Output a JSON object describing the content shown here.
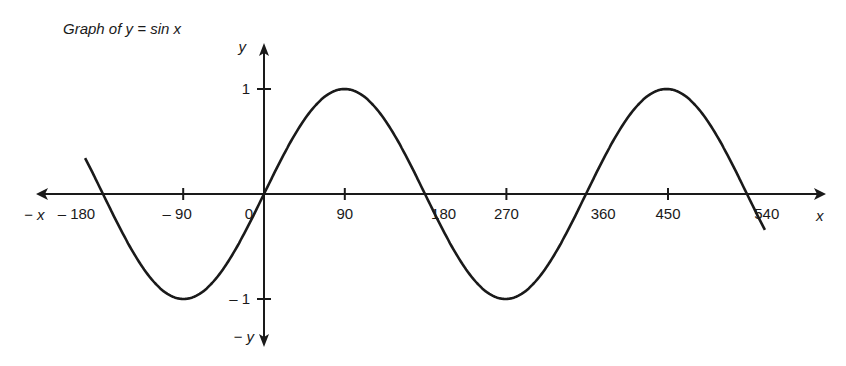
{
  "chart_data": {
    "type": "line",
    "title": "Graph of y = sin x",
    "function": "y = sin x",
    "xlabel": "x",
    "xlabel_negative": "− x",
    "ylabel": "y",
    "ylabel_negative": "− y",
    "x_unit": "degrees",
    "xlim": [
      -200,
      580
    ],
    "ylim": [
      -1,
      1
    ],
    "grid": false,
    "legend": "none",
    "x_ticks": [
      {
        "value": -180,
        "label": "– 180"
      },
      {
        "value": -90,
        "label": "– 90"
      },
      {
        "value": 0,
        "label": "0"
      },
      {
        "value": 90,
        "label": "90"
      },
      {
        "value": 180,
        "label": "180"
      },
      {
        "value": 270,
        "label": "270"
      },
      {
        "value": 360,
        "label": "360"
      },
      {
        "value": 450,
        "label": "450"
      },
      {
        "value": 540,
        "label": "540"
      }
    ],
    "y_ticks": [
      {
        "value": 1,
        "label": "1"
      },
      {
        "value": -1,
        "label": "– 1"
      }
    ],
    "series": [
      {
        "name": "sin x",
        "x_range": [
          -200,
          560
        ],
        "key_points": [
          {
            "x": -180,
            "y": 0
          },
          {
            "x": -90,
            "y": -1
          },
          {
            "x": 0,
            "y": 0
          },
          {
            "x": 90,
            "y": 1
          },
          {
            "x": 180,
            "y": 0
          },
          {
            "x": 270,
            "y": -1
          },
          {
            "x": 360,
            "y": 0
          },
          {
            "x": 450,
            "y": 1
          },
          {
            "x": 540,
            "y": 0
          }
        ]
      }
    ]
  }
}
